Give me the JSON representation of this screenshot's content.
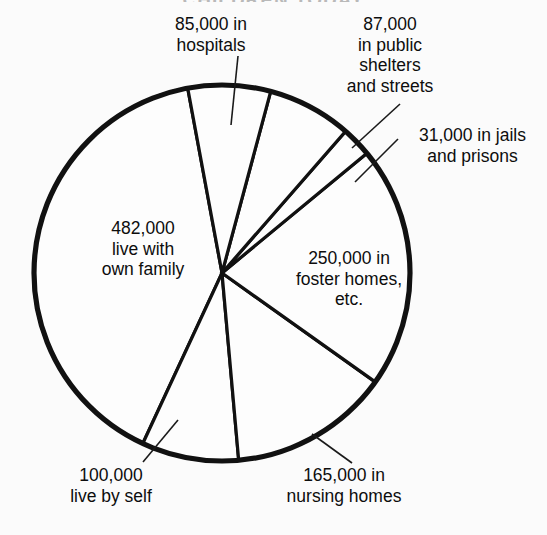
{
  "page": {
    "title_faded": "CHILDREN TODAY",
    "background_color": "#fbfbfb",
    "ink_color": "#111111"
  },
  "chart_data": {
    "type": "pie",
    "title": "",
    "total": 1200000,
    "categories": [
      "482,000 live with own family",
      "85,000 in hospitals",
      "87,000 in public shelters and streets",
      "31,000 in jails and prisons",
      "250,000 in foster homes, etc.",
      "165,000 in nursing homes",
      "100,000 live by self"
    ],
    "values": [
      482000,
      85000,
      87000,
      31000,
      250000,
      165000,
      100000
    ],
    "slice_angles_deg": [
      144.6,
      25.5,
      26.1,
      9.3,
      75.0,
      49.5,
      30.0
    ],
    "labels": {
      "hospitals": "85,000 in\nhospitals",
      "shelters": "87,000\nin public\nshelters\nand streets",
      "jails": "31,000 in jails\nand prisons",
      "foster": "250,000 in\nfoster homes,\netc.",
      "family": "482,000\nlive with\nown family",
      "self": "100,000\nlive by self",
      "nursing": "165,000 in\nnursing homes"
    },
    "legend": "none",
    "grid": false,
    "xlabel": "",
    "ylabel": ""
  }
}
